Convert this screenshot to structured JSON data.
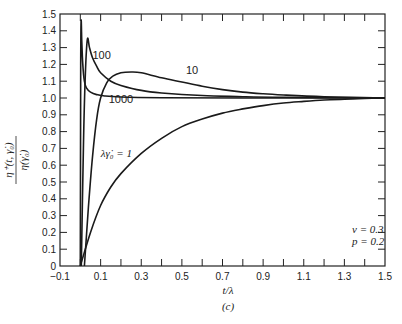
{
  "chart_data": {
    "type": "line",
    "title": "",
    "panel_label": "(c)",
    "xlabel": "t/λ",
    "ylabel": "η⁺(t, γ̇₀) / η(γ̇₀)",
    "xlim": [
      -0.1,
      1.5
    ],
    "ylim": [
      0,
      1.5
    ],
    "x_ticks": [
      -0.1,
      0.1,
      0.3,
      0.5,
      0.7,
      0.9,
      1.1,
      1.3,
      1.5
    ],
    "x_tick_labels": [
      "−0.1",
      "0.1",
      "0.3",
      "0.5",
      "0.7",
      "0.9",
      "1.1",
      "1.3",
      "1.5"
    ],
    "y_ticks": [
      0,
      0.1,
      0.2,
      0.3,
      0.4,
      0.5,
      0.6,
      0.7,
      0.8,
      0.9,
      1.0,
      1.1,
      1.2,
      1.3,
      1.4,
      1.5
    ],
    "y_tick_labels": [
      "0",
      "0.1",
      "0.2",
      "0.3",
      "0.4",
      "0.5",
      "0.6",
      "0.7",
      "0.8",
      "0.9",
      "1.0",
      "1.1",
      "1.2",
      "1.3",
      "1.4",
      "1.5"
    ],
    "grid": false,
    "annotations": [
      "ν = 0.3",
      "p = 0.2"
    ],
    "series": [
      {
        "name": "λγ̇₀ = 1",
        "label": "λγ̇₀ = 1",
        "x": [
          0.0,
          0.05,
          0.1,
          0.15,
          0.2,
          0.3,
          0.4,
          0.5,
          0.6,
          0.7,
          0.8,
          0.9,
          1.0,
          1.1,
          1.2,
          1.3,
          1.4,
          1.5
        ],
        "y": [
          0.0,
          0.2,
          0.36,
          0.47,
          0.55,
          0.67,
          0.76,
          0.83,
          0.875,
          0.91,
          0.935,
          0.955,
          0.97,
          0.98,
          0.988,
          0.993,
          0.997,
          1.0
        ]
      },
      {
        "name": "10",
        "label": "10",
        "x": [
          0.02,
          0.04,
          0.06,
          0.08,
          0.1,
          0.13,
          0.16,
          0.2,
          0.25,
          0.3,
          0.4,
          0.5,
          0.6,
          0.7,
          0.8,
          0.9,
          1.0,
          1.2,
          1.5
        ],
        "y": [
          0.0,
          0.35,
          0.65,
          0.87,
          1.0,
          1.09,
          1.13,
          1.15,
          1.155,
          1.15,
          1.12,
          1.095,
          1.07,
          1.05,
          1.035,
          1.025,
          1.018,
          1.008,
          1.0
        ]
      },
      {
        "name": "100",
        "label": "100",
        "x": [
          0.005,
          0.015,
          0.025,
          0.035,
          0.045,
          0.06,
          0.08,
          0.1,
          0.15,
          0.2,
          0.3,
          0.4,
          0.6,
          0.8,
          1.0,
          1.5
        ],
        "y": [
          0.0,
          0.7,
          1.15,
          1.35,
          1.3,
          1.24,
          1.19,
          1.15,
          1.1,
          1.075,
          1.045,
          1.03,
          1.015,
          1.008,
          1.004,
          1.0
        ]
      },
      {
        "name": "1000",
        "label": "1000",
        "x": [
          0.0,
          0.002,
          0.004,
          0.007,
          0.012,
          0.02,
          0.03,
          0.05,
          0.08,
          0.12,
          0.2,
          0.4,
          0.8,
          1.5
        ],
        "y": [
          0.0,
          1.2,
          1.46,
          1.35,
          1.2,
          1.1,
          1.06,
          1.035,
          1.02,
          1.012,
          1.006,
          1.002,
          1.0,
          1.0
        ]
      }
    ],
    "curve_label_positions": {
      "1": [
        0.1,
        0.65
      ],
      "10": [
        0.52,
        1.14
      ],
      "100": [
        0.06,
        1.23
      ],
      "1000": [
        0.14,
        0.97
      ]
    }
  },
  "labels": {
    "xlabel": "t/λ",
    "panel": "(c)",
    "ylabel_num": "η⁺(t, γ̇₀)",
    "ylabel_den": "η(γ̇₀)",
    "nu": "ν = 0.3",
    "p": "p = 0.2",
    "curve_1": "λγ̇₀ = 1",
    "curve_10": "10",
    "curve_100": "100",
    "curve_1000": "1000"
  }
}
